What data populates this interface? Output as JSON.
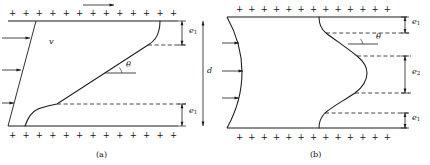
{
  "figure": {
    "type": "physics-diagram",
    "stroke_color": "#1a1a1a",
    "background": "#ffffff",
    "panels": [
      {
        "id": "a",
        "caption": "(a)",
        "plate_charge_symbol": "+",
        "plate_charge_count": 13,
        "velocity_label": "v",
        "angle_label": "θ",
        "gap_label": "d",
        "layer_labels": [
          "e",
          "e"
        ],
        "layer_subscripts": [
          "1",
          "1"
        ],
        "flow_arrow_direction": "right",
        "profile_shape": "linear-core-with-boundary-layers",
        "side_arrow_count": 3
      },
      {
        "id": "b",
        "caption": "(b)",
        "plate_charge_symbol": "+",
        "plate_charge_count": 13,
        "angle_label": "θ",
        "layer_labels": [
          "e",
          "e",
          "e"
        ],
        "layer_subscripts": [
          "1",
          "2",
          "1"
        ],
        "profile_shape": "s-curve-with-reversal",
        "side_arrow_count": 3
      }
    ]
  },
  "labels": {
    "v": "v",
    "theta": "θ",
    "d": "d",
    "e": "e",
    "sub1": "1",
    "sub2": "2",
    "caption_a": "(a)",
    "caption_b": "(b)",
    "plus": "+"
  }
}
